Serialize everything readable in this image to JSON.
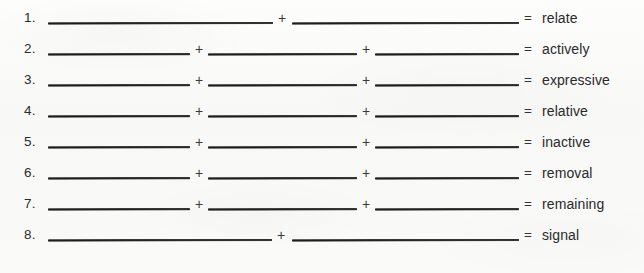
{
  "worksheet": {
    "background_color": "#fbfbfa",
    "ink_color": "#1d1d1d",
    "plus_symbol": "+",
    "equals_symbol": "=",
    "rows": [
      {
        "number": "1.",
        "blanks": 2,
        "answer": "relate",
        "plus_symbols": [
          "+"
        ],
        "segments": [
          {
            "left": 48,
            "width": 225
          },
          {
            "left": 292,
            "width": 227
          }
        ],
        "plus_positions": [
          275
        ],
        "top": 8
      },
      {
        "number": "2.",
        "blanks": 3,
        "answer": "actively",
        "plus_symbols": [
          "+",
          "+"
        ],
        "segments": [
          {
            "left": 48,
            "width": 142
          },
          {
            "left": 208,
            "width": 149
          },
          {
            "left": 375,
            "width": 144
          }
        ],
        "plus_positions": [
          192,
          359
        ],
        "top": 39
      },
      {
        "number": "3.",
        "blanks": 3,
        "answer": "expressive",
        "plus_symbols": [
          "+",
          "+"
        ],
        "segments": [
          {
            "left": 48,
            "width": 142
          },
          {
            "left": 208,
            "width": 149
          },
          {
            "left": 375,
            "width": 144
          }
        ],
        "plus_positions": [
          192,
          359
        ],
        "top": 70
      },
      {
        "number": "4.",
        "blanks": 3,
        "answer": "relative",
        "plus_symbols": [
          "+",
          "+"
        ],
        "segments": [
          {
            "left": 48,
            "width": 142
          },
          {
            "left": 208,
            "width": 149
          },
          {
            "left": 375,
            "width": 144
          }
        ],
        "plus_positions": [
          192,
          359
        ],
        "top": 101
      },
      {
        "number": "5.",
        "blanks": 3,
        "answer": "inactive",
        "plus_symbols": [
          "+",
          "+"
        ],
        "segments": [
          {
            "left": 48,
            "width": 142
          },
          {
            "left": 208,
            "width": 149
          },
          {
            "left": 375,
            "width": 144
          }
        ],
        "plus_positions": [
          192,
          359
        ],
        "top": 132
      },
      {
        "number": "6.",
        "blanks": 3,
        "answer": "removal",
        "plus_symbols": [
          "+",
          "+"
        ],
        "segments": [
          {
            "left": 48,
            "width": 142
          },
          {
            "left": 208,
            "width": 149
          },
          {
            "left": 375,
            "width": 144
          }
        ],
        "plus_positions": [
          192,
          359
        ],
        "top": 163
      },
      {
        "number": "7.",
        "blanks": 3,
        "answer": "remaining",
        "plus_symbols": [
          "+",
          "+"
        ],
        "segments": [
          {
            "left": 48,
            "width": 142
          },
          {
            "left": 208,
            "width": 149
          },
          {
            "left": 375,
            "width": 144
          }
        ],
        "plus_positions": [
          192,
          359
        ],
        "top": 194
      },
      {
        "number": "8.",
        "blanks": 2,
        "answer": "signal",
        "plus_symbols": [
          "+"
        ],
        "segments": [
          {
            "left": 48,
            "width": 224
          },
          {
            "left": 292,
            "width": 227
          }
        ],
        "plus_positions": [
          274
        ],
        "top": 225
      }
    ]
  }
}
